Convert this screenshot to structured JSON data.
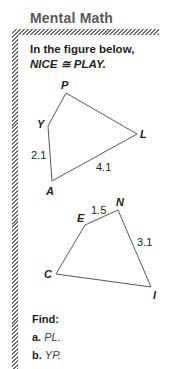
{
  "heading": "Mental Math",
  "prompt": {
    "line1": "In the figure below,",
    "line2": "NICE ≅ PLAY."
  },
  "figure_play": {
    "vertices": {
      "P": [
        66,
        93
      ],
      "L": [
        137,
        134
      ],
      "A": [
        52,
        181
      ],
      "Y": [
        48,
        126
      ]
    },
    "labels": {
      "P": "P",
      "L": "L",
      "A": "A",
      "Y": "Y"
    },
    "measures": {
      "YA": "2.1",
      "AL": "4.1"
    }
  },
  "figure_nice": {
    "vertices": {
      "N": [
        118,
        210
      ],
      "I": [
        151,
        287
      ],
      "C": [
        56,
        274
      ],
      "E": [
        85,
        225
      ]
    },
    "labels": {
      "N": "N",
      "I": "I",
      "C": "C",
      "E": "E"
    },
    "measures": {
      "EN": "1.5",
      "NI": "3.1"
    }
  },
  "find": {
    "title": "Find:",
    "items": [
      {
        "letter": "a.",
        "text": "PL."
      },
      {
        "letter": "b.",
        "text": "YP."
      }
    ]
  },
  "colors": {
    "heading": "#58595b",
    "hatch": "#6d6e71",
    "stroke": "#58595b",
    "text": "#231f20"
  }
}
